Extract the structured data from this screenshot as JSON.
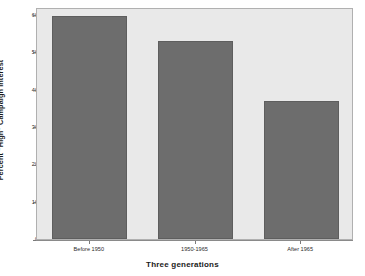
{
  "chart_data": {
    "type": "bar",
    "title": "",
    "categories": [
      "Before 1950",
      "1950-1965",
      "After 1965"
    ],
    "values": [
      59.5,
      53,
      37
    ],
    "xlabel": "Three generations",
    "ylabel": "Percent \"High\" Campaign Interest",
    "ylim": [
      0,
      62
    ],
    "yticks": [
      0,
      10,
      20,
      30,
      40,
      50,
      60
    ],
    "ytick_labels": [
      "0",
      "10",
      "20",
      "30",
      "40",
      "50",
      "60"
    ],
    "grid": false,
    "legend": null,
    "bar_color": "#6d6d6d",
    "plot_background": "#e9e9e9",
    "figure_background": "#ffffff",
    "axis_color": "#8a8a8a"
  }
}
